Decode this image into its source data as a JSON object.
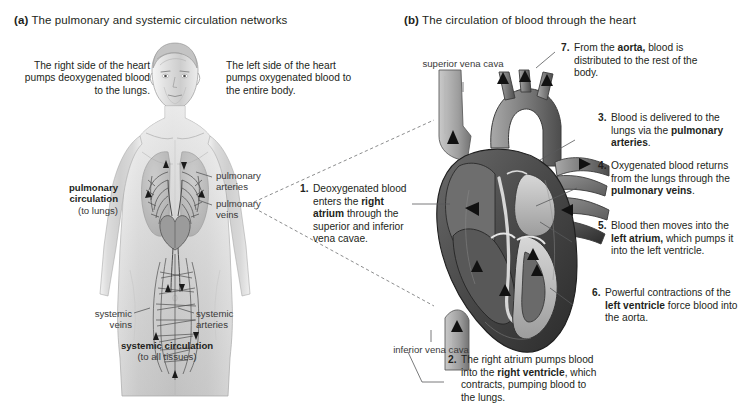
{
  "figure": {
    "panel_a": {
      "tag": "(a)",
      "title": "The pulmonary and systemic circulation networks",
      "left_caption": "The right side of the heart pumps deoxygenated blood to the lungs.",
      "right_caption": "The left side of the heart pumps oxygenated blood to the entire body.",
      "labels": {
        "pulmonary_circulation": "pulmonary circulation",
        "pulmonary_circulation_sub": "(to lungs)",
        "pulmonary_arteries": "pulmonary arteries",
        "pulmonary_veins": "pulmonary veins",
        "systemic_veins": "systemic veins",
        "systemic_arteries": "systemic arteries",
        "systemic_circulation": "systemic circulation",
        "systemic_circulation_sub": "(to all tissues)"
      }
    },
    "panel_b": {
      "tag": "(b)",
      "title": "The circulation of blood through the heart",
      "labels": {
        "superior_vena_cava": "superior vena cava",
        "inferior_vena_cava": "inferior vena cava"
      },
      "steps": [
        {
          "num": "1.",
          "parts": [
            {
              "t": "Deoxygenated blood enters the ",
              "b": false
            },
            {
              "t": "right atrium",
              "b": true
            },
            {
              "t": " through the superior and inferior vena cavae.",
              "b": false
            }
          ]
        },
        {
          "num": "2.",
          "parts": [
            {
              "t": "The right atrium pumps blood into the ",
              "b": false
            },
            {
              "t": "right ventricle",
              "b": true
            },
            {
              "t": ", which contracts, pumping blood to the lungs.",
              "b": false
            }
          ]
        },
        {
          "num": "3.",
          "parts": [
            {
              "t": "Blood is delivered to the lungs via the ",
              "b": false
            },
            {
              "t": "pulmonary arteries",
              "b": true
            },
            {
              "t": ".",
              "b": false
            }
          ]
        },
        {
          "num": "4.",
          "parts": [
            {
              "t": "Oxygenated blood returns from the lungs through the ",
              "b": false
            },
            {
              "t": "pulmonary veins",
              "b": true
            },
            {
              "t": ".",
              "b": false
            }
          ]
        },
        {
          "num": "5.",
          "parts": [
            {
              "t": "Blood then moves into the ",
              "b": false
            },
            {
              "t": "left atrium,",
              "b": true
            },
            {
              "t": " which pumps it into the left ventricle.",
              "b": false
            }
          ]
        },
        {
          "num": "6.",
          "parts": [
            {
              "t": "Powerful contractions of the ",
              "b": false
            },
            {
              "t": "left ventricle",
              "b": true
            },
            {
              "t": " force blood into the aorta.",
              "b": false
            }
          ]
        },
        {
          "num": "7.",
          "parts": [
            {
              "t": "From the ",
              "b": false
            },
            {
              "t": "aorta,",
              "b": true
            },
            {
              "t": " blood is distributed to the rest of the body.",
              "b": false
            }
          ]
        }
      ]
    },
    "colors": {
      "text": "#231f20",
      "label": "#3a3a3a",
      "leader": "#58595b",
      "background": "#ffffff"
    }
  }
}
